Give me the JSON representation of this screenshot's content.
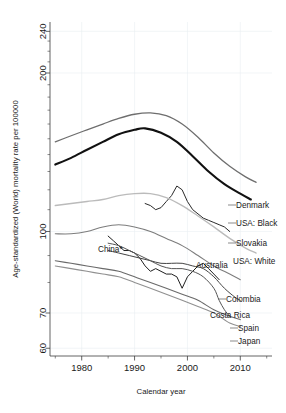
{
  "figure": {
    "background_color": "#ffffff",
    "plot_area": {
      "left": 50,
      "top": 22,
      "right": 272,
      "bottom": 356
    }
  },
  "chart_data": {
    "type": "line",
    "title": "",
    "xlabel": "Calendar year",
    "ylabel": "Age-standardized (World) mortality rate per 100000",
    "yscale": "log",
    "xlim": [
      1974,
      2016
    ],
    "ylim": [
      58,
      250
    ],
    "grid": true,
    "legend_position": "right-inline-labels",
    "x_ticks_major": [
      1980,
      1990,
      2000,
      2010
    ],
    "x_ticks_minor": [
      1975,
      1985,
      1995,
      2005,
      2015
    ],
    "y_ticks_major": [
      60,
      70,
      100,
      200,
      240
    ],
    "y_ticks_minor": [
      80,
      90,
      110,
      120,
      130,
      140,
      150,
      160,
      170,
      180,
      190,
      210,
      220,
      230
    ],
    "y_tick_labels": [
      "60",
      "70",
      "100",
      "200",
      "240"
    ],
    "x_tick_labels": [
      "1980",
      "1990",
      "2000",
      "2010"
    ],
    "series": [
      {
        "name": "Denmark",
        "label": "Denmark",
        "color": "#6e6e6e",
        "width": 1.3,
        "label_x": 236,
        "label_y": 208,
        "points": [
          [
            1975,
            148
          ],
          [
            1978,
            152
          ],
          [
            1981,
            156
          ],
          [
            1984,
            160
          ],
          [
            1987,
            164
          ],
          [
            1990,
            167
          ],
          [
            1993,
            168
          ],
          [
            1996,
            166
          ],
          [
            1999,
            160
          ],
          [
            2002,
            151
          ],
          [
            2005,
            141
          ],
          [
            2008,
            133
          ],
          [
            2011,
            127
          ],
          [
            2013,
            124
          ]
        ]
      },
      {
        "name": "USA: Black",
        "label": "USA: Black",
        "color": "#111111",
        "width": 2.1,
        "label_x": 236,
        "label_y": 226,
        "points": [
          [
            1975,
            134
          ],
          [
            1978,
            138
          ],
          [
            1981,
            143
          ],
          [
            1984,
            148
          ],
          [
            1987,
            153
          ],
          [
            1990,
            156
          ],
          [
            1992,
            157
          ],
          [
            1995,
            154
          ],
          [
            1998,
            148
          ],
          [
            2001,
            139
          ],
          [
            2004,
            130
          ],
          [
            2007,
            123
          ],
          [
            2010,
            118
          ],
          [
            2012,
            115
          ]
        ]
      },
      {
        "name": "Slovakia",
        "label": "Slovakia",
        "color": "#2a2a2a",
        "width": 1.0,
        "label_x": 236,
        "label_y": 246,
        "points": [
          [
            1992,
            113
          ],
          [
            1993,
            112
          ],
          [
            1994,
            110
          ],
          [
            1995,
            111
          ],
          [
            1996,
            114
          ],
          [
            1997,
            117
          ],
          [
            1998,
            122
          ],
          [
            1999,
            120
          ],
          [
            2000,
            114
          ],
          [
            2001,
            110
          ],
          [
            2002,
            108
          ],
          [
            2003,
            106
          ],
          [
            2004,
            105
          ],
          [
            2005,
            104
          ],
          [
            2006,
            103
          ],
          [
            2007,
            102
          ],
          [
            2008,
            100
          ]
        ]
      },
      {
        "name": "USA: White",
        "label": "USA: White",
        "color": "#bbbbbb",
        "width": 1.4,
        "label_x": 233,
        "label_y": 264,
        "points": [
          [
            1975,
            112
          ],
          [
            1978,
            113
          ],
          [
            1981,
            114
          ],
          [
            1984,
            115
          ],
          [
            1987,
            117
          ],
          [
            1990,
            118
          ],
          [
            1993,
            118
          ],
          [
            1996,
            116
          ],
          [
            1999,
            112
          ],
          [
            2002,
            107
          ],
          [
            2005,
            102
          ],
          [
            2008,
            97
          ],
          [
            2011,
            93
          ],
          [
            2013,
            91
          ]
        ]
      },
      {
        "name": "Australia",
        "label": "Australia",
        "color": "#7d7d7d",
        "width": 1.1,
        "label_x": 196,
        "label_y": 268,
        "points": [
          [
            1975,
            99
          ],
          [
            1978,
            99
          ],
          [
            1981,
            100
          ],
          [
            1984,
            102
          ],
          [
            1987,
            103
          ],
          [
            1990,
            102
          ],
          [
            1993,
            100
          ],
          [
            1996,
            97
          ],
          [
            1999,
            94
          ],
          [
            2002,
            90
          ],
          [
            2005,
            86
          ],
          [
            2008,
            83
          ],
          [
            2010,
            81
          ]
        ]
      },
      {
        "name": "China*",
        "label": "China*",
        "color": "#1f1f1f",
        "width": 1.0,
        "label_x": 98,
        "label_y": 252,
        "points": [
          [
            1985,
            98
          ],
          [
            1986,
            96
          ],
          [
            1987,
            94
          ],
          [
            1988,
            92
          ],
          [
            1989,
            92
          ],
          [
            1990,
            91
          ],
          [
            1991,
            89
          ],
          [
            1992,
            86
          ],
          [
            1993,
            84
          ],
          [
            1994,
            85
          ],
          [
            1995,
            84
          ],
          [
            1996,
            83
          ],
          [
            1997,
            83
          ],
          [
            1998,
            82
          ],
          [
            1999,
            78
          ],
          [
            2000,
            82
          ],
          [
            2001,
            84
          ],
          [
            2002,
            86
          ],
          [
            2003,
            87
          ],
          [
            2004,
            85
          ],
          [
            2005,
            83
          ],
          [
            2006,
            81
          ]
        ]
      },
      {
        "name": "Colombia",
        "label": "Colombia",
        "color": "#444444",
        "width": 1.0,
        "label_x": 226,
        "label_y": 302,
        "points": [
          [
            1985,
            92
          ],
          [
            1987,
            91
          ],
          [
            1989,
            90
          ],
          [
            1991,
            89
          ],
          [
            1993,
            88
          ],
          [
            1995,
            87
          ],
          [
            1997,
            87
          ],
          [
            1999,
            87
          ],
          [
            2001,
            86
          ],
          [
            2003,
            85
          ],
          [
            2005,
            82
          ],
          [
            2007,
            78
          ],
          [
            2009,
            75
          ],
          [
            2010,
            74
          ]
        ]
      },
      {
        "name": "Costa Rica",
        "label": "Costa Rica",
        "color": "#555555",
        "width": 1.0,
        "label_x": 210,
        "label_y": 318,
        "points": [
          [
            1985,
            95
          ],
          [
            1987,
            94
          ],
          [
            1989,
            92
          ],
          [
            1991,
            90
          ],
          [
            1993,
            88
          ],
          [
            1995,
            86
          ],
          [
            1997,
            85
          ],
          [
            1999,
            85
          ],
          [
            2001,
            84
          ],
          [
            2003,
            82
          ],
          [
            2005,
            78
          ],
          [
            2006,
            74
          ],
          [
            2007,
            71
          ],
          [
            2008,
            69
          ]
        ]
      },
      {
        "name": "Spain",
        "label": "Spain",
        "color": "#6a6a6a",
        "width": 1.1,
        "label_x": 238,
        "label_y": 331,
        "points": [
          [
            1975,
            88
          ],
          [
            1978,
            87
          ],
          [
            1981,
            86
          ],
          [
            1984,
            85
          ],
          [
            1987,
            84
          ],
          [
            1990,
            82
          ],
          [
            1993,
            80
          ],
          [
            1996,
            78
          ],
          [
            1999,
            76
          ],
          [
            2002,
            74
          ],
          [
            2005,
            71
          ],
          [
            2008,
            69
          ],
          [
            2010,
            68
          ]
        ]
      },
      {
        "name": "Japan",
        "label": "Japan",
        "color": "#909090",
        "width": 1.1,
        "label_x": 238,
        "label_y": 344,
        "points": [
          [
            1975,
            86
          ],
          [
            1978,
            85
          ],
          [
            1981,
            84
          ],
          [
            1984,
            83
          ],
          [
            1987,
            82
          ],
          [
            1990,
            80
          ],
          [
            1993,
            78
          ],
          [
            1996,
            76
          ],
          [
            1999,
            74
          ],
          [
            2002,
            72
          ],
          [
            2005,
            70
          ],
          [
            2008,
            67
          ],
          [
            2010,
            66
          ]
        ]
      }
    ],
    "leader_lines": [
      {
        "name": "denmark-leader",
        "x1": 228,
        "y1": 205,
        "x2": 236,
        "y2": 205
      },
      {
        "name": "usa-black-leader",
        "x1": 228,
        "y1": 223,
        "x2": 236,
        "y2": 223
      },
      {
        "name": "slovakia-leader",
        "x1": 228,
        "y1": 243,
        "x2": 236,
        "y2": 243
      },
      {
        "name": "colombia-leader",
        "x1": 218,
        "y1": 299,
        "x2": 226,
        "y2": 299
      },
      {
        "name": "spain-leader",
        "x1": 230,
        "y1": 328,
        "x2": 238,
        "y2": 328
      },
      {
        "name": "japan-leader",
        "x1": 230,
        "y1": 341,
        "x2": 238,
        "y2": 341
      }
    ]
  }
}
